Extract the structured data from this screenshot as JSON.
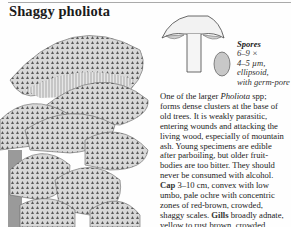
{
  "page": {
    "title": "Shaggy pholiota",
    "illustration": {
      "subject": "cluster of shaggy pholiota mushrooms on wood",
      "style": "grayscale engraving"
    },
    "diagram": {
      "subject": "mushroom cross-section and spore"
    }
  },
  "spores": {
    "label": "Spores",
    "lines": [
      "6–9 ×",
      "4–5 µm,",
      "ellipsoid,",
      "with germ-pore"
    ]
  },
  "description": {
    "lines": [
      {
        "pre": "One of the larger ",
        "italic": "Pholiota",
        "post": " spp;"
      },
      {
        "text": "forms dense clusters at the base of"
      },
      {
        "text": "old trees. It is weakly parasitic,"
      },
      {
        "text": "entering wounds and attacking the"
      },
      {
        "text": "living wood, especially of mountain"
      },
      {
        "text": "ash. Young specimens are edible"
      },
      {
        "text": "after parboiling, but older fruit-"
      },
      {
        "text": "bodies are too bitter. They should"
      },
      {
        "text": "never be consumed with alcohol."
      },
      {
        "kw": "Cap",
        "text": " 3–10 cm, convex with low"
      },
      {
        "text": "umbo, pale ochre with concentric"
      },
      {
        "text": "zones of red-brown, crowded,"
      },
      {
        "pre": "shaggy scales. ",
        "kw": "Gills",
        "text": " broadly adnate,"
      },
      {
        "text": "yellow to rust brown, crowded."
      },
      {
        "kw": "Stem",
        "text": " 7–15 cm, colour as cap with"
      }
    ]
  }
}
